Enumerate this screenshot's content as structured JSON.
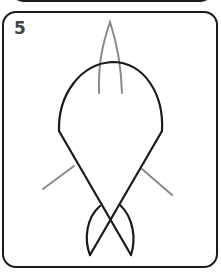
{
  "step": {
    "number": "5"
  },
  "drawing": {
    "subject": "fish",
    "colors": {
      "outline": "#1a1a1a",
      "guide": "#8a8a8a",
      "frame": "#1a1a1a",
      "number": "#444444"
    },
    "parts": [
      "top-fin",
      "body",
      "left-fin",
      "right-fin",
      "tail"
    ]
  }
}
